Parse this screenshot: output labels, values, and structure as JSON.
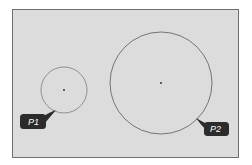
{
  "panel": {
    "x": 12,
    "y": 9,
    "width": 226,
    "height": 148,
    "fill": "#dcdcdc",
    "border": "#6e6e6e"
  },
  "circles": [
    {
      "id": "P1",
      "label": "P1",
      "cx": 64,
      "cy": 90,
      "r": 23,
      "stroke": "#7a7a7a",
      "badge": {
        "x": 20,
        "y": 114,
        "w": 26,
        "h": 15
      }
    },
    {
      "id": "P2",
      "label": "P2",
      "cx": 161,
      "cy": 83,
      "r": 51,
      "stroke": "#5a5a5a",
      "badge": {
        "x": 204,
        "y": 122,
        "w": 25,
        "h": 14
      }
    }
  ],
  "badge_color": "#2b2b2b"
}
